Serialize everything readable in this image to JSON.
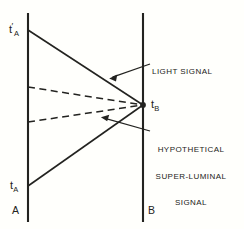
{
  "figure": {
    "name": "spacetime-signal-diagram",
    "background_color": "#fffffc",
    "line_color": "#232320",
    "width": 244,
    "height": 229
  },
  "worldlines": [
    {
      "id": "A",
      "label": "A",
      "x": 28,
      "y_top": 13,
      "y_bottom": 222
    },
    {
      "id": "B",
      "label": "B",
      "x": 143,
      "y_top": 13,
      "y_bottom": 222
    }
  ],
  "events": {
    "t_a_prime": {
      "base": "t",
      "prime": "′",
      "sub": "A",
      "x": 28,
      "y": 30
    },
    "t_a": {
      "base": "t",
      "prime": "",
      "sub": "A",
      "x": 28,
      "y": 186
    },
    "t_b": {
      "base": "t",
      "prime": "",
      "sub": "B",
      "x": 143,
      "y": 105
    }
  },
  "signals": {
    "light": [
      {
        "from": [
          28,
          30
        ],
        "to": [
          143,
          105
        ],
        "style": "solid"
      },
      {
        "from": [
          28,
          186
        ],
        "to": [
          143,
          105
        ],
        "style": "solid"
      }
    ],
    "superluminal": [
      {
        "from": [
          28,
          87
        ],
        "to": [
          143,
          105
        ],
        "style": "dashed"
      },
      {
        "from": [
          28,
          122
        ],
        "to": [
          143,
          105
        ],
        "style": "dashed"
      }
    ]
  },
  "annotations": [
    {
      "id": "light-signal",
      "lines": [
        "LIGHT SIGNAL"
      ],
      "text_x": 152,
      "text_y": 51,
      "leader_from": [
        150,
        64
      ],
      "leader_to": [
        110,
        78
      ]
    },
    {
      "id": "hypothetical-superluminal-signal",
      "lines": [
        "HYPOTHETICAL",
        "SUPER-LUMINAL",
        "SIGNAL"
      ],
      "text_x": 151,
      "text_y": 129,
      "leader_from": [
        150,
        131
      ],
      "leader_to": [
        101,
        117
      ]
    }
  ]
}
